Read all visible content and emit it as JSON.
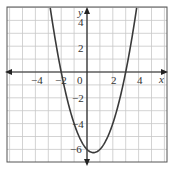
{
  "chart_data": {
    "type": "line",
    "title": "",
    "function": "y = x^2 - x - 6",
    "xlabel": "x",
    "ylabel": "y",
    "xlim": [
      -6,
      6
    ],
    "ylim": [
      -7,
      5
    ],
    "grid": true,
    "x_ticks": [
      "-4",
      "-2",
      "0",
      "2",
      "4"
    ],
    "y_ticks": [
      "4",
      "2",
      "-2",
      "-4",
      "-6"
    ],
    "points": [
      {
        "x": -3,
        "y": 6
      },
      {
        "x": -2,
        "y": 0
      },
      {
        "x": -1,
        "y": -4
      },
      {
        "x": 0,
        "y": -6
      },
      {
        "x": 0.5,
        "y": -6.25
      },
      {
        "x": 1,
        "y": -6
      },
      {
        "x": 2,
        "y": -4
      },
      {
        "x": 3,
        "y": 0
      },
      {
        "x": 4,
        "y": 6
      }
    ],
    "roots": [
      -2,
      3
    ],
    "vertex": {
      "x": 0.5,
      "y": -6.25
    }
  },
  "labels": {
    "x_axis": "x",
    "y_axis": "y",
    "origin": "0",
    "xm4": "−4",
    "xm2": "−2",
    "x2": "2",
    "x4": "4",
    "y4": "4",
    "y2": "2",
    "ym2": "−2",
    "ym4": "−4",
    "ym6": "−6"
  },
  "colors": {
    "curve": "#3a3a3a",
    "grid": "#c8c8c8",
    "axis": "#222222",
    "frame": "#555555"
  }
}
